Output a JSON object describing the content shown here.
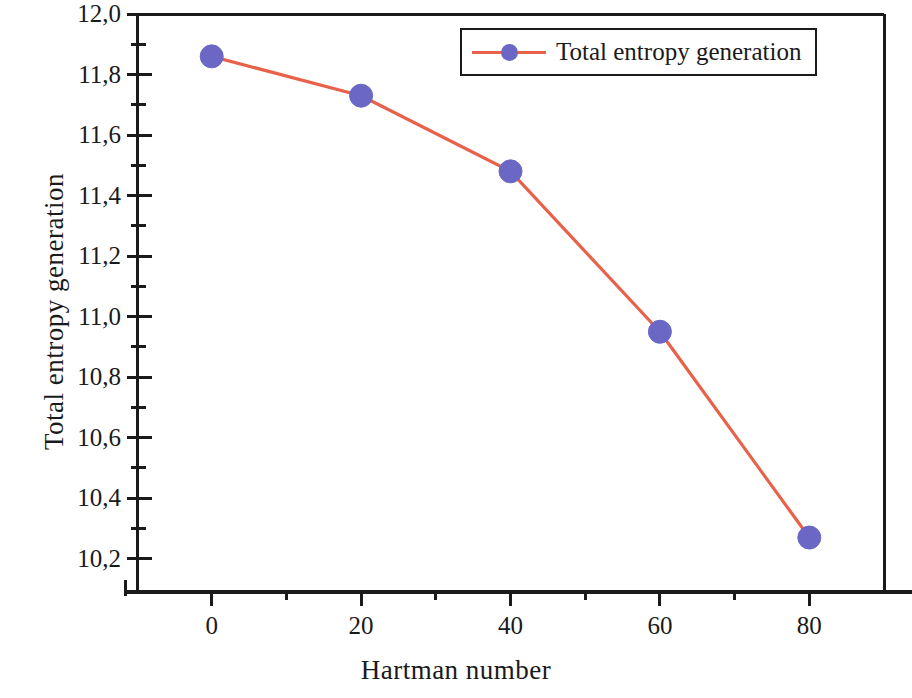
{
  "chart_data": {
    "type": "line",
    "title": "",
    "subtitle": "",
    "xlabel": "Hartman number",
    "ylabel": "Total entropy generation",
    "x": [
      0,
      20,
      40,
      60,
      80
    ],
    "series": [
      {
        "name": "Total entropy generation",
        "values": [
          11.86,
          11.73,
          11.48,
          10.95,
          10.27
        ],
        "line_color": "#e8614a",
        "marker_color": "#6a68c4",
        "marker": "circle"
      }
    ],
    "xlim": [
      -10,
      90
    ],
    "ylim": [
      10.09,
      12.0
    ],
    "xticks": [
      0,
      20,
      40,
      60,
      80
    ],
    "xtick_labels": [
      "0",
      "20",
      "40",
      "60",
      "80"
    ],
    "x_minor_ticks": [
      10,
      30,
      50,
      70
    ],
    "yticks": [
      12.0,
      11.8,
      11.6,
      11.4,
      11.2,
      11.0,
      10.8,
      10.6,
      10.4,
      10.2
    ],
    "ytick_labels": [
      "12,0",
      "11,8",
      "11,6",
      "11,4",
      "11,2",
      "11,0",
      "10,8",
      "10,6",
      "10,4",
      "10,2"
    ],
    "y_minor_ticks": [
      11.9,
      11.7,
      11.5,
      11.3,
      11.1,
      10.9,
      10.7,
      10.5,
      10.3
    ],
    "grid": false,
    "legend": {
      "position": "top-right",
      "entries": [
        "Total entropy generation"
      ]
    },
    "decimal_separator": ","
  },
  "figure": {
    "background_color": "#ffffff",
    "axis_color": "#1a1a1a",
    "frame": {
      "left": 137,
      "top": 14,
      "right": 884,
      "bottom": 592
    }
  },
  "legend": {
    "label": "Total entropy generation"
  },
  "axes": {
    "x_title": "Hartman number",
    "y_title": "Total entropy generation"
  }
}
